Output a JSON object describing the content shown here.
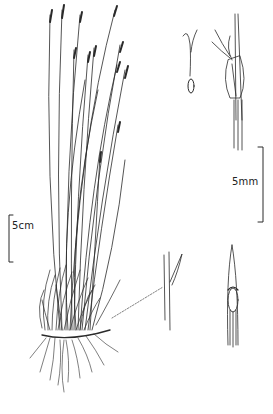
{
  "illustration": {
    "subject": "grass-like plant (tufted habit) with floral details",
    "ink_color": "#2a2a2a",
    "background": "#ffffff"
  },
  "scale_bars": [
    {
      "label": "5cm",
      "position": "left-middle"
    },
    {
      "label": "5mm",
      "position": "right-middle"
    }
  ],
  "panels": [
    {
      "name": "habit",
      "description": "whole plant with tufted base and roots"
    },
    {
      "name": "pistil-detail",
      "description": "ovary with feathery stigmas"
    },
    {
      "name": "spikelet-detail",
      "description": "spikelet with glumes and stigmas"
    },
    {
      "name": "leaf-tip-detail",
      "description": "leaf sheath/ligule detail"
    },
    {
      "name": "stem-inset",
      "description": "enlarged node linked by dotted line"
    }
  ]
}
